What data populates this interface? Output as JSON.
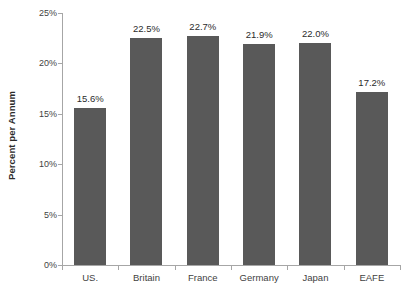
{
  "chart_data": {
    "type": "bar",
    "title": "",
    "subtitle": "",
    "xlabel": "",
    "ylabel": "Percent per Annum",
    "categories": [
      "US.",
      "Britain",
      "France",
      "Germany",
      "Japan",
      "EAFE"
    ],
    "values": [
      15.6,
      22.5,
      22.7,
      21.9,
      22.0,
      17.2
    ],
    "data_labels": [
      "15.6%",
      "22.5%",
      "22.7%",
      "21.9%",
      "22.0%",
      "17.2%"
    ],
    "ylim": [
      0,
      25
    ],
    "ytick_values": [
      0,
      5,
      10,
      15,
      20,
      25
    ],
    "ytick_labels": [
      "0%",
      "5%",
      "10%",
      "15%",
      "20%",
      "25%"
    ],
    "grid": false,
    "legend": null,
    "series": [
      {
        "name": "Percent per Annum",
        "values": [
          15.6,
          22.5,
          22.7,
          21.9,
          22.0,
          17.2
        ]
      }
    ],
    "colors": {
      "bar": "#595959",
      "axis": "#a6a6a6",
      "text": "#3f3f3f",
      "background": "#ffffff"
    }
  }
}
